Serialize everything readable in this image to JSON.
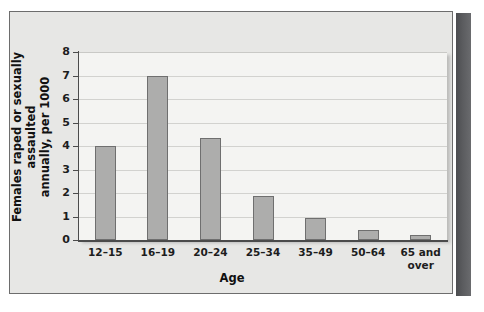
{
  "chart_data": {
    "type": "bar",
    "title": "",
    "subtitle": "",
    "xlabel": "Age",
    "ylabel_line1": "Females raped or sexually assaulted",
    "ylabel_line2": "annually, per 1000",
    "ylabel": "Females raped or sexually assaulted annually, per 1000",
    "categories": [
      "12–15",
      "16–19",
      "20–24",
      "25–34",
      "35–49",
      "50–64",
      "65 and over"
    ],
    "category_lines": [
      [
        "12–15"
      ],
      [
        "16–19"
      ],
      [
        "20–24"
      ],
      [
        "25–34"
      ],
      [
        "35–49"
      ],
      [
        "50–64"
      ],
      [
        "65 and",
        "over"
      ]
    ],
    "values": [
      4.0,
      7.0,
      4.35,
      1.88,
      0.95,
      0.42,
      0.22
    ],
    "ylim": [
      0,
      8
    ],
    "yticks": [
      0,
      1,
      2,
      3,
      4,
      5,
      6,
      7,
      8
    ],
    "ytick_labels": [
      "0",
      "1",
      "2",
      "3",
      "4",
      "5",
      "6",
      "7",
      "8"
    ],
    "grid": true,
    "grid_axis": "y",
    "legend": false,
    "legend_position": "none",
    "bar_fill_color": "#adadac",
    "bar_edge_color": "#6f6f6f",
    "plot_background": "#f4f4f2",
    "panel_background": "#e7e7e5",
    "gridline_color": "#d2d2cf",
    "axis_color": "#4b4b4b",
    "text_color": "#1d1d1d",
    "spine_color": "#56575a"
  }
}
